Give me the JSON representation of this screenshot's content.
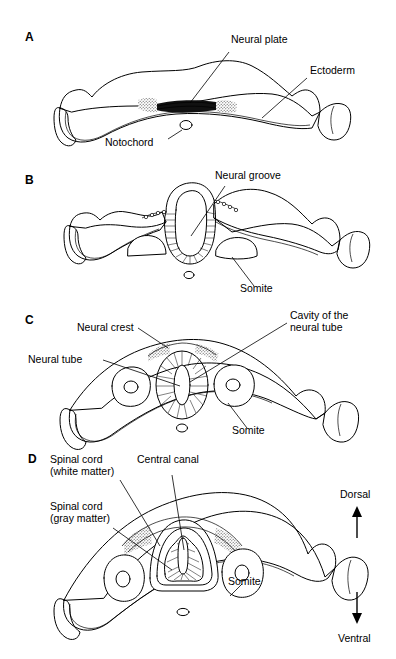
{
  "figure": {
    "type": "biological-diagram",
    "panel_count": 4,
    "ink_color": "#000000",
    "background_color": "#ffffff",
    "stipple_color": "#9a9a9a"
  },
  "panels": [
    {
      "letter": "A",
      "stage_name": "neural-plate",
      "labels": [
        {
          "name": "neural-plate",
          "text": "Neural plate"
        },
        {
          "name": "ectoderm",
          "text": "Ectoderm"
        },
        {
          "name": "notochord",
          "text": "Notochord"
        }
      ]
    },
    {
      "letter": "B",
      "stage_name": "neural-groove",
      "labels": [
        {
          "name": "neural-groove",
          "text": "Neural groove"
        },
        {
          "name": "somite",
          "text": "Somite"
        }
      ]
    },
    {
      "letter": "C",
      "stage_name": "neural-tube",
      "labels": [
        {
          "name": "neural-crest",
          "text": "Neural crest"
        },
        {
          "name": "neural-tube",
          "text": "Neural tube"
        },
        {
          "name": "cavity-of-neural-tube-line1",
          "text": "Cavity of the"
        },
        {
          "name": "cavity-of-neural-tube-line2",
          "text": "neural tube"
        },
        {
          "name": "somite",
          "text": "Somite"
        }
      ]
    },
    {
      "letter": "D",
      "stage_name": "spinal-cord",
      "labels": [
        {
          "name": "spinal-cord-white-matter-line1",
          "text": "Spinal cord"
        },
        {
          "name": "spinal-cord-white-matter-line2",
          "text": "(white matter)"
        },
        {
          "name": "spinal-cord-gray-matter-line1",
          "text": "Spinal cord"
        },
        {
          "name": "spinal-cord-gray-matter-line2",
          "text": "(gray matter)"
        },
        {
          "name": "central-canal",
          "text": "Central canal"
        },
        {
          "name": "somite",
          "text": "Somite"
        }
      ]
    }
  ],
  "orientation": {
    "dorsal": "Dorsal",
    "ventral": "Ventral"
  }
}
